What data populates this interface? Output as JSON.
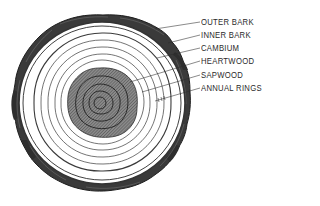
{
  "diagram": {
    "colors": {
      "ink": "#2a2a2a",
      "bark": "#3a3a3a",
      "heartwood_fill": "#7a7a7a",
      "background": "#ffffff"
    },
    "labels": [
      {
        "id": "outer-bark",
        "text": "OUTER BARK"
      },
      {
        "id": "inner-bark",
        "text": "INNER BARK"
      },
      {
        "id": "cambium",
        "text": "CAMBIUM"
      },
      {
        "id": "heartwood",
        "text": "HEARTWOOD"
      },
      {
        "id": "sapwood",
        "text": "SAPWOOD"
      },
      {
        "id": "annual-rings",
        "text": "ANNUAL RINGS"
      }
    ]
  }
}
